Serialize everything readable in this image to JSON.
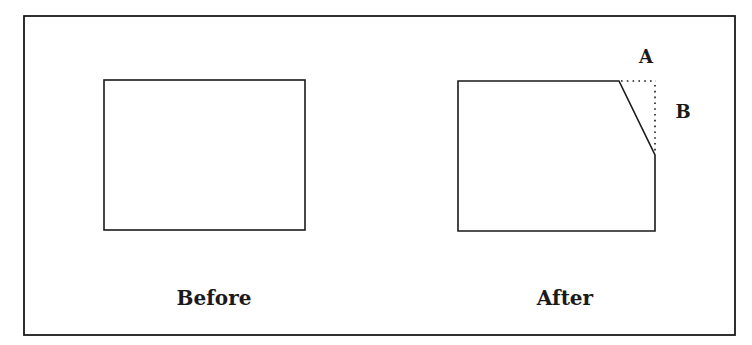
{
  "diagram": {
    "colors": {
      "line": "#1a1a1a",
      "background": "#ffffff"
    },
    "frame": {
      "x": 24,
      "y": 16,
      "width": 711,
      "height": 319
    },
    "before": {
      "caption": "Before",
      "shape": {
        "x": 104,
        "y": 80,
        "width": 201,
        "height": 150
      }
    },
    "after": {
      "caption": "After",
      "shape_points": [
        [
          458,
          81
        ],
        [
          619,
          81
        ],
        [
          655,
          155
        ],
        [
          655,
          231
        ],
        [
          458,
          231
        ]
      ],
      "removed_corner": {
        "corner_x": 655,
        "corner_y": 81
      },
      "dimension_labels": {
        "horizontal": "A",
        "vertical": "B"
      }
    }
  }
}
